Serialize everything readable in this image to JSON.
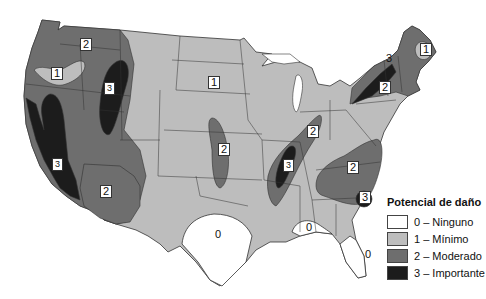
{
  "map": {
    "title": "Potencial de daño",
    "colors": {
      "0": "#ffffff",
      "1": "#bdbdbd",
      "2": "#6e6e6e",
      "3": "#1c1c1c",
      "border": "#333333"
    },
    "region_labels": [
      {
        "id": "pacific-nw-2",
        "text": "2",
        "x": 84,
        "y": 44
      },
      {
        "id": "oregon-1",
        "text": "1",
        "x": 55,
        "y": 73
      },
      {
        "id": "idaho-utah-3",
        "text": "3",
        "x": 108,
        "y": 88
      },
      {
        "id": "california-3",
        "text": "3",
        "x": 56,
        "y": 164
      },
      {
        "id": "arizona-2",
        "text": "2",
        "x": 104,
        "y": 191
      },
      {
        "id": "dakota-1",
        "text": "1",
        "x": 212,
        "y": 82
      },
      {
        "id": "plains-2",
        "text": "2",
        "x": 222,
        "y": 149
      },
      {
        "id": "new-madrid-3",
        "text": "3",
        "x": 286,
        "y": 165
      },
      {
        "id": "ohio-valley-2",
        "text": "2",
        "x": 311,
        "y": 131
      },
      {
        "id": "carolinas-2",
        "text": "2",
        "x": 351,
        "y": 167
      },
      {
        "id": "charleston-3",
        "text": "3",
        "x": 363,
        "y": 196
      },
      {
        "id": "northeast-2",
        "text": "2",
        "x": 383,
        "y": 87
      },
      {
        "id": "maine-1",
        "text": "1",
        "x": 424,
        "y": 49
      },
      {
        "id": "st-lawrence-3",
        "text": "3",
        "x": 387,
        "y": 59
      },
      {
        "id": "texas-0",
        "text": "0",
        "x": 216,
        "y": 234
      },
      {
        "id": "gulf-0",
        "text": "0",
        "x": 306,
        "y": 224
      },
      {
        "id": "florida-0",
        "text": "0",
        "x": 366,
        "y": 255
      }
    ]
  },
  "legend": {
    "title": "Potencial de daño",
    "items": [
      {
        "value": "0",
        "label": "0 – Ninguno",
        "color": "#ffffff"
      },
      {
        "value": "1",
        "label": "1 – Mínimo",
        "color": "#bdbdbd"
      },
      {
        "value": "2",
        "label": "2 – Moderado",
        "color": "#6e6e6e"
      },
      {
        "value": "3",
        "label": "3 – Importante",
        "color": "#1c1c1c"
      }
    ]
  }
}
